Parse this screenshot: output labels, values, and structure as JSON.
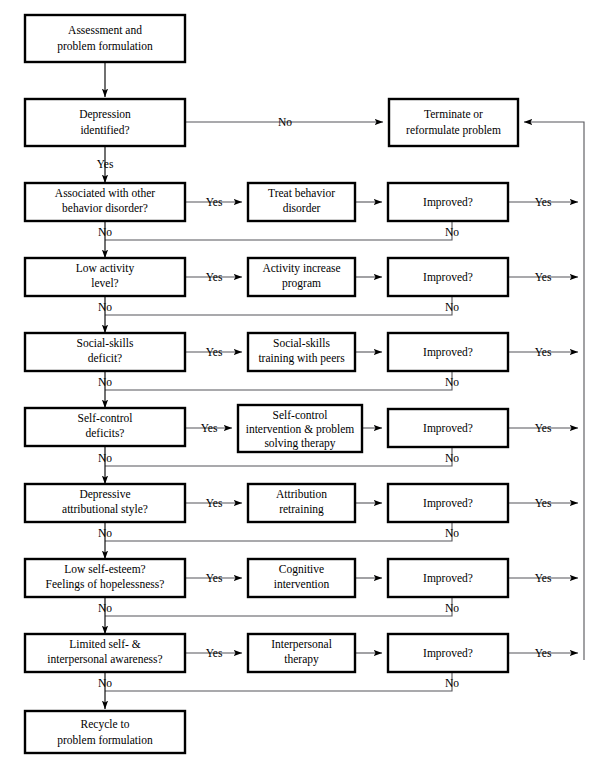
{
  "diagram": {
    "colors": {
      "line": "#55555a",
      "box_border": "#000000",
      "background": "#ffffff",
      "text": "#000000"
    },
    "labels": {
      "yes": "Yes",
      "no": "No",
      "improved": "Improved?"
    },
    "start_box": {
      "line1": "Assessment and",
      "line2": "problem formulation"
    },
    "decision_box": {
      "line1": "Depression",
      "line2": "identified?"
    },
    "terminate_box": {
      "line1": "Terminate or",
      "line2": "reformulate problem"
    },
    "end_box": {
      "line1": "Recycle to",
      "line2": "problem formulation"
    },
    "rows": [
      {
        "id": "behavior-disorder",
        "question": {
          "line1": "Associated with other",
          "line2": "behavior disorder?"
        },
        "treatment": {
          "line1": "Treat behavior",
          "line2": "disorder"
        },
        "outcome": "Improved?",
        "yes": "Yes",
        "no": "No",
        "outcome_yes": "Yes",
        "outcome_no": "No"
      },
      {
        "id": "low-activity",
        "question": {
          "line1": "Low activity",
          "line2": "level?"
        },
        "treatment": {
          "line1": "Activity increase",
          "line2": "program"
        },
        "outcome": "Improved?",
        "yes": "Yes",
        "no": "No",
        "outcome_yes": "Yes",
        "outcome_no": "No"
      },
      {
        "id": "social-skills",
        "question": {
          "line1": "Social-skills",
          "line2": "deficit?"
        },
        "treatment": {
          "line1": "Social-skills",
          "line2": "training with peers"
        },
        "outcome": "Improved?",
        "yes": "Yes",
        "no": "No",
        "outcome_yes": "Yes",
        "outcome_no": "No"
      },
      {
        "id": "self-control",
        "question": {
          "line1": "Self-control",
          "line2": "deficits?"
        },
        "treatment": {
          "line1": "Self-control",
          "line2": "intervention & problem",
          "line3": "solving therapy"
        },
        "outcome": "Improved?",
        "yes": "Yes",
        "no": "No",
        "outcome_yes": "Yes",
        "outcome_no": "No"
      },
      {
        "id": "attributional-style",
        "question": {
          "line1": "Depressive",
          "line2": "attributional style?"
        },
        "treatment": {
          "line1": "Attribution",
          "line2": "retraining"
        },
        "outcome": "Improved?",
        "yes": "Yes",
        "no": "No",
        "outcome_yes": "Yes",
        "outcome_no": "No"
      },
      {
        "id": "self-esteem",
        "question": {
          "line1": "Low self-esteem?",
          "line2": "Feelings of hopelessness?"
        },
        "treatment": {
          "line1": "Cognitive",
          "line2": "intervention"
        },
        "outcome": "Improved?",
        "yes": "Yes",
        "no": "No",
        "outcome_yes": "Yes",
        "outcome_no": "No"
      },
      {
        "id": "interpersonal-awareness",
        "question": {
          "line1": "Limited self- &",
          "line2": "interpersonal awareness?"
        },
        "treatment": {
          "line1": "Interpersonal",
          "line2": "therapy"
        },
        "outcome": "Improved?",
        "yes": "Yes",
        "no": "No",
        "outcome_yes": "Yes",
        "outcome_no": "No"
      }
    ],
    "top_branch": {
      "label": "No"
    },
    "start_to_decision": {
      "label": ""
    },
    "decision_yes": {
      "label": "Yes"
    }
  }
}
